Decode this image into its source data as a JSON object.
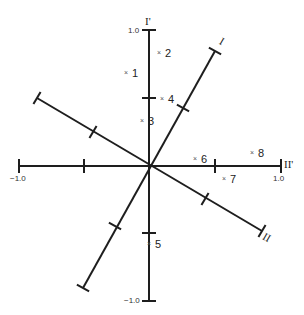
{
  "diagram": {
    "type": "rotated-axes-factor-plot",
    "origin": [
      149,
      166
    ],
    "colors": {
      "line": "#1e1e1e",
      "text": "#222222",
      "marker": "#555555",
      "background": "#ffffff"
    },
    "axes": [
      {
        "name": "I'",
        "label": "I'",
        "from": [
          149,
          301
        ],
        "to": [
          149,
          30
        ],
        "ticks": [
          [
            149,
            98
          ],
          [
            149,
            233
          ]
        ],
        "end_ticks": true
      },
      {
        "name": "II'",
        "label": "II'",
        "from": [
          19,
          166
        ],
        "to": [
          281,
          166
        ],
        "ticks": [
          [
            84,
            166
          ],
          [
            215,
            166
          ]
        ],
        "end_ticks": true
      },
      {
        "name": "I",
        "label": "I",
        "from": [
          83,
          288
        ],
        "to": [
          215,
          51
        ],
        "ticks": [
          [
            183,
            108
          ],
          [
            115,
            226
          ]
        ],
        "end_ticks": true
      },
      {
        "name": "II",
        "label": "II",
        "from": [
          37,
          98
        ],
        "to": [
          262,
          231
        ],
        "ticks": [
          [
            93,
            132
          ],
          [
            205,
            199
          ]
        ],
        "end_ticks": true
      }
    ],
    "tick_labels": {
      "top": "1.0",
      "bottom": "−1.0",
      "left": "−1.0",
      "right": "1.0"
    },
    "axis_labels": {
      "i_prime": "I'",
      "ii_prime": "II'",
      "i": "I",
      "ii": "II"
    },
    "marker_glyph": "×",
    "points": [
      {
        "id": "1",
        "label": "1",
        "x": 127,
        "y": 73
      },
      {
        "id": "2",
        "label": "2",
        "x": 160,
        "y": 53
      },
      {
        "id": "3",
        "label": "3",
        "x": 143,
        "y": 121
      },
      {
        "id": "4",
        "label": "4",
        "x": 163,
        "y": 99
      },
      {
        "id": "5",
        "label": "5",
        "x": 150,
        "y": 244
      },
      {
        "id": "6",
        "label": "6",
        "x": 196,
        "y": 159
      },
      {
        "id": "7",
        "label": "7",
        "x": 225,
        "y": 179
      },
      {
        "id": "8",
        "label": "8",
        "x": 253,
        "y": 153
      }
    ]
  }
}
